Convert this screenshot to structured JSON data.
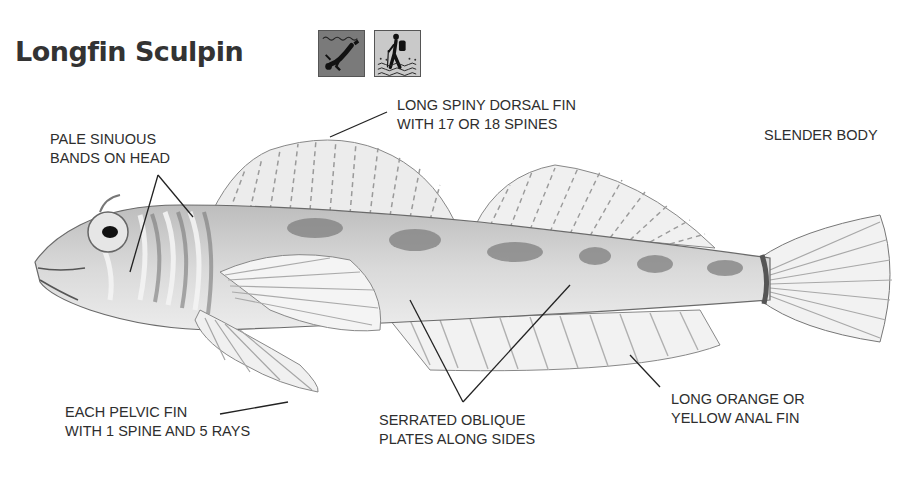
{
  "header": {
    "title": "Longfin Sculpin",
    "icons": [
      {
        "name": "scuba-diver-icon",
        "background": "#7a7a7a"
      },
      {
        "name": "hiker-tidepool-icon",
        "background": "#c9c9c9"
      }
    ]
  },
  "callouts": {
    "dorsal": {
      "line1": "LONG SPINY DORSAL FIN",
      "line2": "WITH 17 OR 18 SPINES"
    },
    "head": {
      "line1": "PALE SINUOUS",
      "line2": "BANDS ON HEAD"
    },
    "body": {
      "line1": "SLENDER BODY"
    },
    "pelvic": {
      "line1": "EACH PELVIC FIN",
      "line2": "WITH 1 SPINE AND 5 RAYS"
    },
    "plates": {
      "line1": "SERRATED OBLIQUE",
      "line2": "PLATES ALONG SIDES"
    },
    "anal": {
      "line1": "LONG ORANGE OR",
      "line2": "YELLOW ANAL FIN"
    }
  },
  "colors": {
    "ink": "#2e2e2e",
    "fish_fill": "#d8d8d8",
    "fish_dark": "#7a7a7a"
  }
}
